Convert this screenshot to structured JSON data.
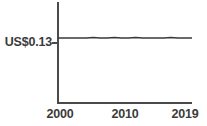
{
  "chart_data": {
    "type": "line",
    "title": "",
    "subtitle": "",
    "xlabel": "",
    "ylabel": "",
    "grid": false,
    "legend": null,
    "xlim": [
      2000,
      2019
    ],
    "ylim": [
      0,
      0.2
    ],
    "y_tick_labels": [
      "US$0.13"
    ],
    "y_tick_values": [
      0.13
    ],
    "x_tick_labels": [
      "2000",
      "2010",
      "2019"
    ],
    "x_tick_values": [
      2000,
      2010,
      2019
    ],
    "series": [
      {
        "name": "price",
        "color": "#3a3a3a",
        "x": [
          2000,
          2001,
          2002,
          2003,
          2004,
          2005,
          2006,
          2007,
          2008,
          2009,
          2010,
          2011,
          2012,
          2013,
          2014,
          2015,
          2016,
          2017,
          2018,
          2019
        ],
        "values": [
          0.13,
          0.13,
          0.13,
          0.13,
          0.13,
          0.131,
          0.13,
          0.13,
          0.131,
          0.13,
          0.13,
          0.131,
          0.13,
          0.13,
          0.13,
          0.13,
          0.131,
          0.13,
          0.13,
          0.13
        ]
      }
    ]
  },
  "axes": {
    "y_axis_color": "#4a4a4a",
    "x_axis_color": "#4a4a4a",
    "y_tick_label": "US$0.13",
    "x_tick_label_start": "2000",
    "x_tick_label_mid": "2010",
    "x_tick_label_end": "2019"
  }
}
